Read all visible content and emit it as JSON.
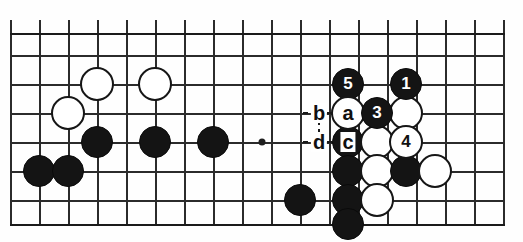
{
  "diagram": {
    "type": "go-board-diagram",
    "board": {
      "cell": 29,
      "origin_x": 10,
      "origin_y": 33,
      "cols": 18,
      "rows": 7,
      "x_lines": [
        10,
        39,
        68,
        97,
        126,
        155,
        184,
        213,
        242,
        271,
        300,
        329,
        358,
        387,
        416,
        445,
        474,
        503
      ],
      "y_lines": [
        33,
        55,
        84,
        113,
        142,
        171,
        200,
        224
      ],
      "star_points": [
        {
          "x": 262,
          "y": 142
        }
      ],
      "top_edge_y": 33,
      "bottom_edge_y": 224,
      "grid_color": "#2b2b2b",
      "background": "#fefefe"
    },
    "stones": [
      {
        "id": "w-d16",
        "color": "white",
        "x": 97,
        "y": 84,
        "label": ""
      },
      {
        "id": "w-f16",
        "color": "white",
        "x": 155,
        "y": 84,
        "label": ""
      },
      {
        "id": "w-c15",
        "color": "white",
        "x": 68,
        "y": 113,
        "label": ""
      },
      {
        "id": "b-d14",
        "color": "black",
        "x": 97,
        "y": 142,
        "label": ""
      },
      {
        "id": "b-f14",
        "color": "black",
        "x": 155,
        "y": 142,
        "label": ""
      },
      {
        "id": "b-h14",
        "color": "black",
        "x": 213,
        "y": 142,
        "label": ""
      },
      {
        "id": "b-b13",
        "color": "black",
        "x": 39,
        "y": 171,
        "label": ""
      },
      {
        "id": "b-c13",
        "color": "black",
        "x": 68,
        "y": 171,
        "label": ""
      },
      {
        "id": "b-move5",
        "color": "black",
        "x": 348,
        "y": 84,
        "label": "5"
      },
      {
        "id": "b-move1",
        "color": "black",
        "x": 406,
        "y": 84,
        "label": "1"
      },
      {
        "id": "w-move2",
        "color": "white",
        "x": 348,
        "y": 113,
        "label": "2"
      },
      {
        "id": "b-move3",
        "color": "black",
        "x": 377,
        "y": 113,
        "label": "3"
      },
      {
        "id": "w-p15",
        "color": "white",
        "x": 406,
        "y": 113,
        "label": ""
      },
      {
        "id": "b-o14",
        "color": "black",
        "x": 348,
        "y": 142,
        "label": ""
      },
      {
        "id": "w-p14",
        "color": "white",
        "x": 377,
        "y": 142,
        "label": ""
      },
      {
        "id": "w-move4",
        "color": "white",
        "x": 406,
        "y": 142,
        "label": "4"
      },
      {
        "id": "b-o13",
        "color": "black",
        "x": 348,
        "y": 171,
        "label": ""
      },
      {
        "id": "w-p13",
        "color": "white",
        "x": 377,
        "y": 171,
        "label": ""
      },
      {
        "id": "b-q13",
        "color": "black",
        "x": 406,
        "y": 171,
        "label": ""
      },
      {
        "id": "w-r13",
        "color": "white",
        "x": 435,
        "y": 171,
        "label": ""
      },
      {
        "id": "b-m12",
        "color": "black",
        "x": 300,
        "y": 200,
        "label": ""
      },
      {
        "id": "b-o12",
        "color": "black",
        "x": 348,
        "y": 200,
        "label": ""
      },
      {
        "id": "w-p12",
        "color": "white",
        "x": 377,
        "y": 200,
        "label": ""
      },
      {
        "id": "b-o11",
        "color": "black",
        "x": 348,
        "y": 224,
        "label": ""
      }
    ],
    "letter_markers": [
      {
        "id": "marker-b",
        "label": "b",
        "x": 319,
        "y": 113
      },
      {
        "id": "marker-a",
        "label": "a",
        "x": 348,
        "y": 113
      },
      {
        "id": "marker-d",
        "label": "d",
        "x": 319,
        "y": 142
      },
      {
        "id": "marker-c",
        "label": "c",
        "x": 348,
        "y": 142
      }
    ],
    "connectors": {
      "note": "dashed segments linking the lettered points"
    }
  }
}
